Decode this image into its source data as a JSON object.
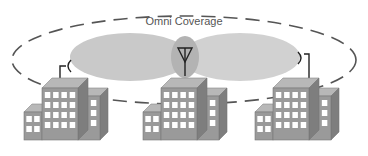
{
  "diagram": {
    "title": "Omni Coverage",
    "nodes": [
      {
        "id": "left-building",
        "antenna": "directional-dish-right"
      },
      {
        "id": "center-building",
        "antenna": "omni-antenna"
      },
      {
        "id": "right-building",
        "antenna": "directional-dish-left"
      }
    ],
    "coverage": [
      "left-lobe",
      "right-lobe"
    ],
    "colors": {
      "lobe": "#c8c8c8",
      "overlap": "#b0b0b0",
      "building_front": "#9a9a9a",
      "building_side": "#7e7e7e",
      "building_top": "#b8b8b8",
      "window": "#ffffff",
      "dashed": "#555555"
    }
  }
}
